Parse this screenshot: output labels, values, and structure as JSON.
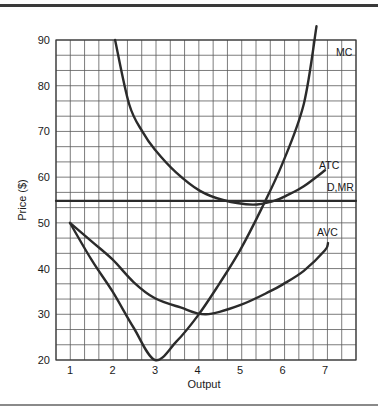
{
  "chart_data": {
    "type": "line",
    "title": "",
    "xlabel": "Output",
    "ylabel": "Price ($)",
    "xlim": [
      0.67,
      7.73
    ],
    "ylim": [
      20,
      90
    ],
    "grid": true,
    "x_ticks": [
      "1",
      "2",
      "3",
      "4",
      "5",
      "6",
      "7"
    ],
    "y_ticks": [
      "20",
      "30",
      "40",
      "50",
      "60",
      "70",
      "80",
      "90"
    ],
    "series": [
      {
        "name": "MC",
        "points": [
          [
            1,
            50
          ],
          [
            1.5,
            42
          ],
          [
            2,
            35
          ],
          [
            2.5,
            27
          ],
          [
            3,
            20
          ],
          [
            3.5,
            24
          ],
          [
            4,
            29.6
          ],
          [
            4.5,
            36.5
          ],
          [
            5,
            44
          ],
          [
            5.5,
            53
          ],
          [
            6,
            63
          ],
          [
            6.5,
            76
          ],
          [
            6.8,
            93
          ]
        ]
      },
      {
        "name": "ATC",
        "points": [
          [
            2.06,
            90
          ],
          [
            2.39,
            76
          ],
          [
            2.7,
            70
          ],
          [
            3,
            66
          ],
          [
            3.5,
            61
          ],
          [
            4.06,
            57
          ],
          [
            4.6,
            55
          ],
          [
            5.3,
            54
          ],
          [
            5.8,
            54.8
          ],
          [
            6.1,
            56
          ],
          [
            6.5,
            58
          ],
          [
            7,
            61.5
          ]
        ]
      },
      {
        "name": "AVC",
        "points": [
          [
            1,
            50
          ],
          [
            1.5,
            46
          ],
          [
            2,
            42
          ],
          [
            2.5,
            37
          ],
          [
            3,
            33.5
          ],
          [
            3.6,
            31.5
          ],
          [
            4.2,
            30
          ],
          [
            5,
            32
          ],
          [
            5.7,
            35
          ],
          [
            6,
            36.5
          ],
          [
            6.5,
            39.5
          ],
          [
            7,
            44
          ],
          [
            7.07,
            45.6
          ]
        ]
      },
      {
        "name": "D,MR",
        "points": [
          [
            0.67,
            54.8
          ],
          [
            7.73,
            54.8
          ]
        ]
      }
    ],
    "annotations": [
      "MC",
      "ATC",
      "D,MR",
      "AVC"
    ]
  },
  "labels": {
    "mc": "MC",
    "atc": "ATC",
    "dmr": "D,MR",
    "avc": "AVC",
    "xlabel": "Output",
    "ylabel": "Price ($)"
  },
  "ticks": {
    "x": [
      "1",
      "2",
      "3",
      "4",
      "5",
      "6",
      "7"
    ],
    "y": [
      "90",
      "80",
      "70",
      "60",
      "50",
      "40",
      "30",
      "20"
    ]
  },
  "colors": {
    "curve": "#2b2b2b",
    "grid": "#5a5a5a",
    "background": "#ffffff"
  }
}
